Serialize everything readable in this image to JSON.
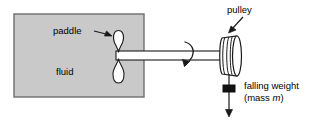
{
  "figure": {
    "type": "physics-apparatus-diagram",
    "labels": {
      "paddle": "paddle",
      "fluid": "fluid",
      "pulley": "pulley",
      "falling_weight": "falling weight",
      "mass_prefix": "(mass ",
      "mass_symbol": "m",
      "mass_suffix": ")"
    },
    "colors": {
      "fluid_fill": "#c9c9c9",
      "fluid_stroke": "#6e6e6e",
      "outline": "#1a1a1a",
      "shaft_fill": "#ffffff",
      "pulley_fill": "#ffffff",
      "weight_fill": "#111111",
      "background": "#ffffff"
    },
    "parts": {
      "container": "fluid-container-box",
      "paddle_blades": 2,
      "shaft": "horizontal-rotating-shaft",
      "rotation_arrow": "curved-rotation-arrow",
      "pulley": "cylindrical-pulley",
      "string": "vertical-string",
      "weight": "black-square-weight",
      "fall_arrow": "downward-arrow"
    }
  }
}
